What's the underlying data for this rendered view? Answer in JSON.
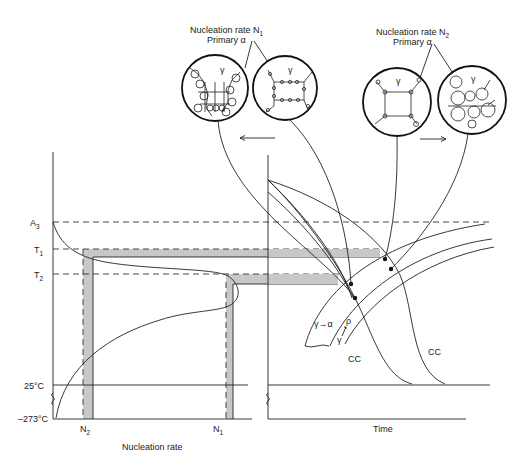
{
  "figure": {
    "left_panel": {
      "y_labels": {
        "a3": "A",
        "a3_sub": "3",
        "t1": "T",
        "t1_sub": "1",
        "t2": "T",
        "t2_sub": "2",
        "room": "25°C",
        "abs": "–273°C"
      },
      "x_ticks": {
        "n2": "N",
        "n2_sub": "2",
        "n1": "N",
        "n1_sub": "1"
      },
      "x_label": "Nucleation rate"
    },
    "right_panel": {
      "x_label": "Time",
      "curve_labels": {
        "cc_left": "CC",
        "cc_right": "CC"
      },
      "transformation_label": "γ→α",
      "rho_label": "ρ",
      "gamma_label": "γ"
    },
    "micrographs": {
      "group_n1": {
        "title": "Nucleation rate N",
        "title_sub": "1",
        "subtitle": "Primary α",
        "gamma": "γ",
        "arrow": "left"
      },
      "group_n2": {
        "title": "Nucleation rate N",
        "title_sub": "2",
        "subtitle": "Primary α",
        "gamma": "γ",
        "arrow": "right"
      }
    },
    "colors": {
      "line": "#222222",
      "band": "#c8c8c8",
      "background": "#ffffff"
    }
  }
}
